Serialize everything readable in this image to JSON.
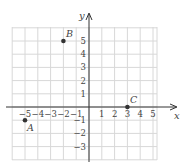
{
  "chart_data": {
    "type": "scatter",
    "title": "",
    "xlabel": "x",
    "ylabel": "y",
    "xlim": [
      -6,
      5.5
    ],
    "ylim": [
      -4,
      6
    ],
    "grid": true,
    "x_ticks": [
      -5,
      -4,
      -3,
      -2,
      -1,
      1,
      2,
      3,
      4,
      5
    ],
    "y_ticks": [
      -3,
      -2,
      -1,
      1,
      2,
      3,
      4,
      5
    ],
    "points": [
      {
        "label": "A",
        "x": -5,
        "y": -1
      },
      {
        "label": "B",
        "x": -2,
        "y": 5
      },
      {
        "label": "C",
        "x": 3,
        "y": 0
      }
    ]
  },
  "labels": {
    "x_axis": "x",
    "y_axis": "y",
    "A": "A",
    "B": "B",
    "C": "C"
  }
}
